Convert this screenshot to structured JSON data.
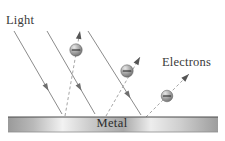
{
  "figure": {
    "background_color": "#ffffff",
    "width": 225,
    "height": 141,
    "labels": {
      "light": "Light",
      "electrons": "Electrons",
      "metal": "Metal"
    },
    "label_positions": {
      "light": {
        "x": 6,
        "y": 24
      },
      "electrons": {
        "x": 162,
        "y": 66
      },
      "metal": {
        "x": 112,
        "y": 127
      }
    },
    "colors": {
      "label_text": "#3a3a3a",
      "metal_text": "#2b2b2b",
      "incident_ray": "#8c8c8c",
      "incident_arrowhead": "#6e6e6e",
      "electron_path": "#a6a6a6",
      "electron_arrowhead": "#555555",
      "electron_sphere_dark": "#6b6b6b",
      "electron_sphere_light": "#d8d8d8",
      "bar_edge_top": "#4a4a4a",
      "bar_gradient_dark": "#8f8f8f",
      "bar_gradient_light": "#fbfbfb"
    },
    "metal_bar": {
      "x": 8,
      "y": 117,
      "width": 210,
      "height": 15,
      "gradient_stops": [
        {
          "offset": "0%",
          "color": "#9a9a9a"
        },
        {
          "offset": "12%",
          "color": "#b9b9b9"
        },
        {
          "offset": "26%",
          "color": "#f2f2f2"
        },
        {
          "offset": "40%",
          "color": "#c9c9c9"
        },
        {
          "offset": "55%",
          "color": "#a9a9a9"
        },
        {
          "offset": "68%",
          "color": "#ededed"
        },
        {
          "offset": "82%",
          "color": "#cfcfcf"
        },
        {
          "offset": "100%",
          "color": "#9d9d9d"
        }
      ]
    },
    "incident_rays": [
      {
        "name": "ray-1",
        "x1": 14,
        "y1": 31,
        "x2": 62,
        "y2": 114,
        "head_t": 0.72
      },
      {
        "name": "ray-2",
        "x1": 47,
        "y1": 31,
        "x2": 95,
        "y2": 114,
        "head_t": 0.72
      },
      {
        "name": "ray-3",
        "x1": 88,
        "y1": 31,
        "x2": 141,
        "y2": 115,
        "head_t": 0.8
      }
    ],
    "electron_tracks": [
      {
        "name": "electron-1",
        "x1": 65,
        "y1": 116,
        "x2": 80,
        "y2": 31,
        "electron_x": 76,
        "electron_y": 50,
        "electron_r": 6.2
      },
      {
        "name": "electron-2",
        "x1": 106,
        "y1": 116,
        "x2": 140,
        "y2": 57,
        "electron_x": 127,
        "electron_y": 71,
        "electron_r": 6.2
      },
      {
        "name": "electron-3",
        "x1": 146,
        "y1": 117,
        "x2": 189,
        "y2": 74,
        "electron_x": 167,
        "electron_y": 96,
        "electron_r": 5.8
      }
    ]
  }
}
